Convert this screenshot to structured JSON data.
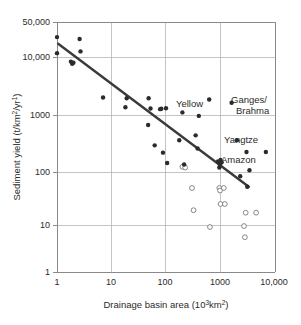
{
  "figure": {
    "title": "",
    "background": "#ffffff",
    "width": 301,
    "height": 325
  },
  "colors": {
    "filled_marker": "#2b2b2b",
    "open_marker_stroke": "#7a7a7a",
    "trend_line": "#3a3a3a",
    "grid": "#b5b5b5",
    "axis": "#8a8a8a",
    "text": "#2b2b2b"
  },
  "axes": {
    "x": {
      "label_prefix": "Drainage basin area (10",
      "label_sup": "3",
      "label_mid": "km",
      "label_sup2": "2",
      "label_suffix": ")",
      "label_full": "Drainage basin area (10³km²)",
      "scale": "log",
      "ticks": [
        "1",
        "10",
        "100",
        "1000",
        "10,000"
      ],
      "tick_values": [
        1,
        10,
        100,
        1000,
        10000
      ],
      "range": [
        1,
        10000
      ]
    },
    "y": {
      "label_prefix": "Sediment yield (t/km",
      "label_sup": "2",
      "label_mid": "/yr",
      "label_sup2": "1",
      "label_suffix": ")",
      "label_full": "Sediment yield (t/km²/yr¹)",
      "scale": "log",
      "ticks": [
        "50,000",
        "10,000",
        "1000",
        "100",
        "10",
        "1"
      ],
      "tick_values": [
        50000,
        10000,
        1000,
        100,
        10,
        1
      ],
      "range": [
        1,
        50000
      ]
    }
  },
  "annotations": [
    {
      "id": "yellow",
      "text": "Yellow",
      "x": 600,
      "y": 1750
    },
    {
      "id": "ganges",
      "line1": "Ganges/",
      "line2": "Brahma",
      "x": 2200,
      "y": 1800
    },
    {
      "id": "yangtze",
      "text": "Yangtze",
      "x": 1900,
      "y": 380
    },
    {
      "id": "amazon",
      "text": "Amazon",
      "x": 1900,
      "y": 200
    }
  ],
  "chart_data": {
    "type": "scatter",
    "title": "",
    "xlabel": "Drainage basin area (10³km²)",
    "ylabel": "Sediment yield (t/km²/yr¹)",
    "xscale": "log",
    "yscale": "log",
    "xlim": [
      1,
      10000
    ],
    "ylim": [
      1,
      50000
    ],
    "grid": true,
    "legend": "none",
    "series": [
      {
        "name": "filled",
        "marker": "filled-circle",
        "color": "#2b2b2b",
        "points": [
          [
            1.0,
            26000
          ],
          [
            1.0,
            13000
          ],
          [
            1.8,
            9000
          ],
          [
            1.9,
            8200
          ],
          [
            2.0,
            8600
          ],
          [
            2.6,
            24000
          ],
          [
            2.7,
            14000
          ],
          [
            7.0,
            1900
          ],
          [
            18,
            1250
          ],
          [
            19,
            1850
          ],
          [
            47,
            580
          ],
          [
            48,
            1850
          ],
          [
            52,
            1180
          ],
          [
            62,
            240
          ],
          [
            78,
            1150
          ],
          [
            82,
            1170
          ],
          [
            88,
            175
          ],
          [
            100,
            1200
          ],
          [
            105,
            112
          ],
          [
            175,
            300
          ],
          [
            200,
            1000
          ],
          [
            215,
            105
          ],
          [
            350,
            370
          ],
          [
            380,
            210
          ],
          [
            400,
            860
          ],
          [
            620,
            1750
          ],
          [
            900,
            120
          ],
          [
            950,
            92
          ],
          [
            980,
            105
          ],
          [
            1000,
            128
          ],
          [
            1050,
            115
          ],
          [
            1600,
            1520
          ],
          [
            2000,
            300
          ],
          [
            2300,
            63
          ],
          [
            3000,
            180
          ],
          [
            3100,
            40
          ],
          [
            3400,
            82
          ],
          [
            6800,
            180
          ]
        ]
      },
      {
        "name": "open",
        "marker": "open-circle",
        "color": "#ffffff",
        "points": [
          [
            200,
            95
          ],
          [
            225,
            92
          ],
          [
            300,
            38
          ],
          [
            320,
            14.5
          ],
          [
            640,
            7.0
          ],
          [
            950,
            38
          ],
          [
            980,
            34
          ],
          [
            1000,
            19
          ],
          [
            1150,
            38
          ],
          [
            1200,
            19
          ],
          [
            2700,
            7.3
          ],
          [
            2800,
            4.5
          ],
          [
            2900,
            13
          ],
          [
            4500,
            13
          ]
        ]
      }
    ],
    "trend_line": {
      "name": "regression",
      "color": "#3a3a3a",
      "start": [
        1.05,
        19500
      ],
      "end": [
        3300,
        40
      ]
    }
  }
}
